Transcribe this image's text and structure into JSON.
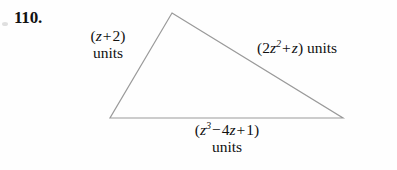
{
  "exercise": {
    "number": "110."
  },
  "figure": {
    "shape_name": "triangle",
    "stroke_color": "#9a9a9a",
    "stroke_width": 1.2,
    "fill": "none",
    "vertices": {
      "apex": [
        172,
        13
      ],
      "bottom_left": [
        110,
        118
      ],
      "bottom_right": [
        343,
        118
      ]
    }
  },
  "labels": {
    "left_side": {
      "expression_open": "(",
      "variable": "z",
      "operator": "+",
      "constant": "2",
      "expression_close": ")",
      "units": "units",
      "full_text": "(z + 2) units"
    },
    "right_side": {
      "expression_open": "(",
      "coefficient": "2",
      "variable": "z",
      "exponent": "2",
      "operator": "+",
      "term2": "z",
      "expression_close": ")",
      "units": "units",
      "full_text": "(2z² + z) units"
    },
    "bottom_side": {
      "expression_open": "(",
      "variable": "z",
      "exponent": "3",
      "operator1": "−",
      "coefficient2": "4",
      "variable2": "z",
      "operator2": "+",
      "constant": "1",
      "expression_close": ")",
      "units": "units",
      "full_text": "(z³ − 4z + 1) units"
    }
  },
  "colors": {
    "background": "#fefefe",
    "text": "#111111",
    "figure_stroke": "#9a9a9a"
  }
}
